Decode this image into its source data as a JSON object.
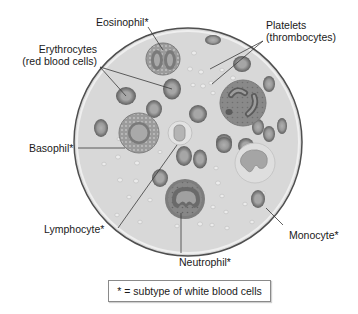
{
  "diagram": {
    "labels": {
      "eosinophil": "Eosinophil*",
      "erythrocytes_line1": "Erythrocytes",
      "erythrocytes_line2": "(red blood cells)",
      "platelets_line1": "Platelets",
      "platelets_line2": "(thrombocytes)",
      "basophil": "Basophil*",
      "lymphocyte": "Lymphocyte*",
      "neutrophil": "Neutrophil*",
      "monocyte": "Monocyte*"
    },
    "legend": "* = subtype of white blood cells",
    "colors": {
      "plasma": "#d9d9d9",
      "rim": "#5a5a5a",
      "rbc_outer": "#6e6e6e",
      "rbc_inner": "#a3a3a3",
      "wbc_cytoplasm": "#8c8c8c",
      "nucleus": "#707070",
      "leader_line": "#3a3a3a"
    }
  }
}
